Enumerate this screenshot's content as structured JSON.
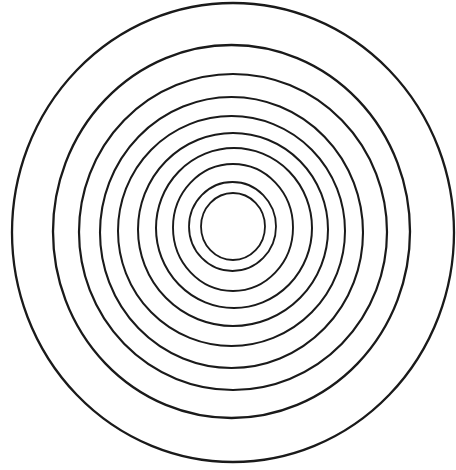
{
  "diagram": {
    "type": "concentric-rings",
    "background": "#ffffff",
    "stroke_color": "#1a1a1a",
    "ring_count": 10,
    "rings": [
      {
        "cx": 233,
        "cy": 226.5,
        "rx": 32,
        "ry": 33.5,
        "stroke_width": 1.8
      },
      {
        "cx": 232.5,
        "cy": 226.5,
        "rx": 43.5,
        "ry": 44.5,
        "stroke_width": 1.8
      },
      {
        "cx": 233,
        "cy": 227.5,
        "rx": 60,
        "ry": 63.5,
        "stroke_width": 1.9
      },
      {
        "cx": 234,
        "cy": 228,
        "rx": 78,
        "ry": 80,
        "stroke_width": 2.0
      },
      {
        "cx": 233,
        "cy": 229.5,
        "rx": 95,
        "ry": 96.5,
        "stroke_width": 2.0
      },
      {
        "cx": 231.5,
        "cy": 231,
        "rx": 113.5,
        "ry": 115,
        "stroke_width": 2.0
      },
      {
        "cx": 231.5,
        "cy": 232.5,
        "rx": 131.5,
        "ry": 135.5,
        "stroke_width": 2.1
      },
      {
        "cx": 233,
        "cy": 232,
        "rx": 154,
        "ry": 158,
        "stroke_width": 2.2
      },
      {
        "cx": 231.5,
        "cy": 231.5,
        "rx": 178.5,
        "ry": 186.5,
        "stroke_width": 2.3
      },
      {
        "cx": 233,
        "cy": 232.5,
        "rx": 221,
        "ry": 229.5,
        "stroke_width": 2.3
      }
    ]
  }
}
